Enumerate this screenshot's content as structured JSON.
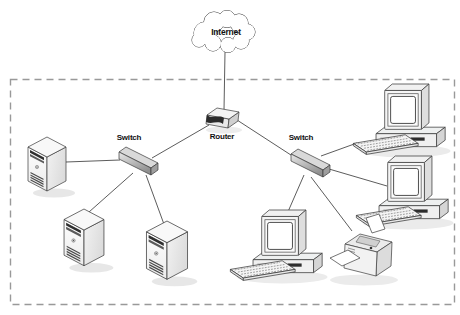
{
  "diagram": {
    "kind": "network-topology",
    "labels": {
      "internet": "Internet",
      "router": "Router",
      "switch_left": "Switch",
      "switch_right": "Switch"
    },
    "nodes": [
      {
        "id": "internet",
        "type": "cloud",
        "label": "Internet"
      },
      {
        "id": "router",
        "type": "router",
        "label": "Router"
      },
      {
        "id": "switch-left",
        "type": "switch",
        "label": "Switch"
      },
      {
        "id": "switch-right",
        "type": "switch",
        "label": "Switch"
      },
      {
        "id": "server-1",
        "type": "server-tower",
        "label": ""
      },
      {
        "id": "server-2",
        "type": "server-tower",
        "label": ""
      },
      {
        "id": "server-3",
        "type": "server-tower",
        "label": ""
      },
      {
        "id": "workstation-1",
        "type": "desktop-computer",
        "label": ""
      },
      {
        "id": "workstation-2",
        "type": "desktop-computer",
        "label": ""
      },
      {
        "id": "workstation-3",
        "type": "desktop-computer",
        "label": ""
      },
      {
        "id": "printer-1",
        "type": "printer",
        "label": ""
      }
    ],
    "connections": [
      {
        "from": "internet",
        "to": "router"
      },
      {
        "from": "router",
        "to": "switch-left"
      },
      {
        "from": "router",
        "to": "switch-right"
      },
      {
        "from": "switch-left",
        "to": "server-1"
      },
      {
        "from": "switch-left",
        "to": "server-2"
      },
      {
        "from": "switch-left",
        "to": "server-3"
      },
      {
        "from": "switch-right",
        "to": "workstation-1"
      },
      {
        "from": "switch-right",
        "to": "workstation-2"
      },
      {
        "from": "switch-right",
        "to": "workstation-3"
      },
      {
        "from": "switch-right",
        "to": "printer-1"
      }
    ],
    "colors": {
      "background": "#ffffff",
      "connection_line": "#4a4a4a",
      "device_outline": "#3a3a3a",
      "dashed_border": "#999999",
      "label_text": "#111111",
      "device_light": "#f5f5f5",
      "device_mid": "#d9d9d9",
      "device_dark": "#9e9e9e"
    }
  }
}
